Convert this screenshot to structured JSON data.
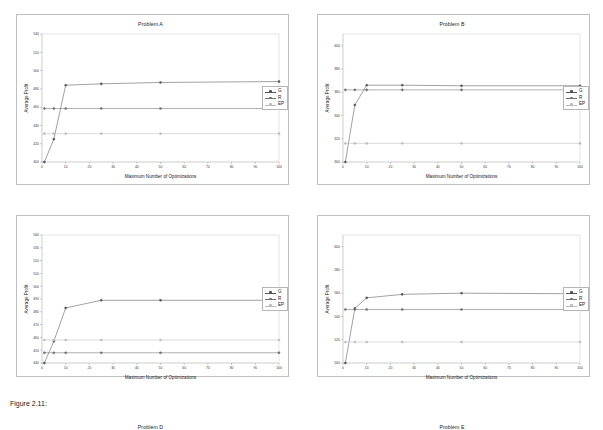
{
  "page": {
    "caption": "Figure 2.11:",
    "background_color": "#ffffff",
    "panel_border_color": "#bfbfbf"
  },
  "legend": {
    "entries": [
      {
        "label": "G",
        "color": "#555555"
      },
      {
        "label": "R",
        "color": "#6f6f6f"
      },
      {
        "label": "EP",
        "color": "#bcbcbc"
      }
    ]
  },
  "chart_data": [
    {
      "type": "line",
      "title": "Problem A",
      "xlabel": "Maximum Number of Optimizations",
      "ylabel": "Average Profit",
      "x": [
        1,
        5,
        10,
        25,
        50,
        100
      ],
      "xlim": [
        0,
        100
      ],
      "xticks": [
        0,
        10,
        20,
        30,
        40,
        50,
        60,
        70,
        80,
        90,
        100
      ],
      "ylim": [
        400,
        540
      ],
      "yticks": [
        400,
        420,
        440,
        460,
        480,
        500,
        520,
        540
      ],
      "grid": false,
      "legend_position": "right",
      "series": [
        {
          "name": "G",
          "values": [
            400,
            425,
            484,
            485.5,
            487,
            488
          ]
        },
        {
          "name": "R",
          "values": [
            458.5,
            458.5,
            458.5,
            458.5,
            458.5,
            458.5
          ]
        },
        {
          "name": "EP",
          "values": [
            431,
            431,
            431,
            431,
            431,
            431
          ]
        }
      ]
    },
    {
      "type": "line",
      "title": "Problem B",
      "xlabel": "Maximum Number of Optimizations",
      "ylabel": "Average Profit",
      "x": [
        1,
        5,
        10,
        25,
        50,
        100
      ],
      "xlim": [
        0,
        100
      ],
      "xticks": [
        0,
        10,
        20,
        30,
        40,
        50,
        60,
        70,
        80,
        90,
        100
      ],
      "ylim": [
        300,
        410
      ],
      "yticks": [
        300,
        320,
        340,
        360,
        380,
        400
      ],
      "grid": false,
      "legend_position": "right",
      "series": [
        {
          "name": "G",
          "values": [
            300,
            349,
            366,
            366,
            365.5,
            365.5
          ]
        },
        {
          "name": "R",
          "values": [
            362,
            362,
            362,
            362,
            362,
            362
          ]
        },
        {
          "name": "EP",
          "values": [
            316,
            316,
            316,
            316,
            316,
            316
          ]
        }
      ]
    },
    {
      "type": "line",
      "title": "Problem D",
      "xlabel": "Maximum Number of Optimizations",
      "ylabel": "Average Profit",
      "x": [
        1,
        5,
        10,
        25,
        50,
        100
      ],
      "xlim": [
        0,
        100
      ],
      "xticks": [
        0,
        10,
        20,
        30,
        40,
        50,
        60,
        70,
        80,
        90,
        100
      ],
      "ylim": [
        440,
        540
      ],
      "yticks": [
        440,
        450,
        460,
        470,
        480,
        490,
        500,
        510,
        520,
        530,
        540
      ],
      "grid": false,
      "legend_position": "right",
      "series": [
        {
          "name": "G",
          "values": [
            440,
            457,
            483,
            489,
            489,
            489
          ]
        },
        {
          "name": "R",
          "values": [
            448,
            448,
            448,
            448,
            448,
            448
          ]
        },
        {
          "name": "EP",
          "values": [
            458,
            458,
            458,
            458,
            458,
            458
          ]
        }
      ]
    },
    {
      "type": "line",
      "title": "Problem E",
      "xlabel": "Maximum Number of Optimizations",
      "ylabel": "Average Profit",
      "x": [
        1,
        5,
        10,
        25,
        50,
        100
      ],
      "xlim": [
        0,
        100
      ],
      "xticks": [
        0,
        10,
        20,
        30,
        40,
        50,
        60,
        70,
        80,
        90,
        100
      ],
      "ylim": [
        500,
        610
      ],
      "yticks": [
        500,
        520,
        540,
        560,
        580,
        600
      ],
      "grid": false,
      "legend_position": "right",
      "series": [
        {
          "name": "G",
          "values": [
            500,
            547,
            556,
            559,
            560,
            559.5
          ]
        },
        {
          "name": "R",
          "values": [
            546,
            546,
            546,
            546,
            546,
            546
          ]
        },
        {
          "name": "EP",
          "values": [
            518,
            518,
            518,
            518,
            518,
            518
          ]
        }
      ]
    }
  ]
}
